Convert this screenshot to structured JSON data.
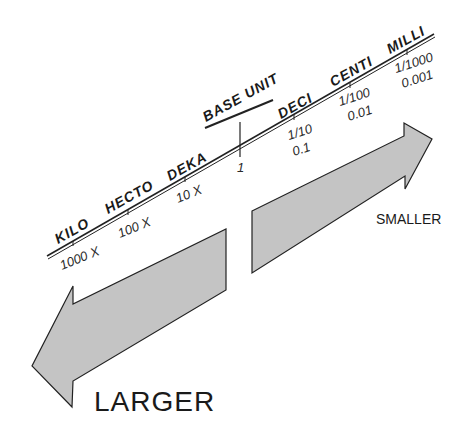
{
  "diagram": {
    "scale_items": [
      {
        "prefix": "KILO",
        "factor": "1000 X",
        "decimal": ""
      },
      {
        "prefix": "HECTO",
        "factor": "100 X",
        "decimal": ""
      },
      {
        "prefix": "DEKA",
        "factor": "10 X",
        "decimal": ""
      },
      {
        "prefix": "BASE UNIT",
        "factor": "1",
        "decimal": ""
      },
      {
        "prefix": "DECI",
        "factor": "1/10",
        "decimal": "0.1"
      },
      {
        "prefix": "CENTI",
        "factor": "1/100",
        "decimal": "0.01"
      },
      {
        "prefix": "MILLI",
        "factor": "1/1000",
        "decimal": "0.001"
      }
    ],
    "arrows": {
      "larger": {
        "label": "LARGER",
        "direction": "left-down"
      },
      "smaller": {
        "label": "SMALLER",
        "direction": "right-up"
      }
    },
    "colors": {
      "arrow_fill": "#c4c4c4",
      "line": "#222222",
      "background": "#ffffff"
    }
  }
}
